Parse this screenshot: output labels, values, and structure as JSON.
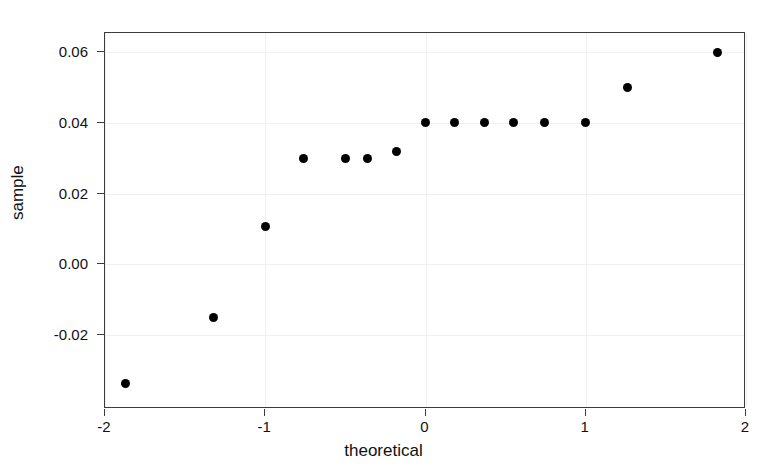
{
  "figure": {
    "top_cutoff_text": "— —  —— —  ——— ——  ————  —— ———"
  },
  "chart_data": {
    "type": "scatter",
    "title": "",
    "xlabel": "theoretical",
    "ylabel": "sample",
    "xlim": [
      -2,
      2
    ],
    "ylim": [
      -0.0408,
      0.0653
    ],
    "grid": true,
    "legend": null,
    "xticks": [
      -2,
      -1,
      0,
      1,
      2
    ],
    "xticklabels": [
      "-2",
      "-1",
      "0",
      "1",
      "2"
    ],
    "yticks": [
      0.06,
      0.04,
      0.02,
      0.0,
      -0.02
    ],
    "yticklabels": [
      "0.06",
      "0.04",
      "0.02",
      "0.00",
      "-0.02"
    ],
    "marker": "filled-circle",
    "marker_color": "#000000",
    "x": [
      -1.87,
      -1.32,
      -1.0,
      -0.76,
      -0.5,
      -0.36,
      -0.18,
      0.0,
      0.18,
      0.37,
      0.55,
      0.74,
      1.0,
      1.26,
      1.82
    ],
    "y": [
      -0.0335,
      -0.015,
      0.0106,
      0.03,
      0.03,
      0.03,
      0.032,
      0.04,
      0.04,
      0.04,
      0.04,
      0.04,
      0.04,
      0.05,
      0.0597
    ],
    "n_points": 15
  }
}
